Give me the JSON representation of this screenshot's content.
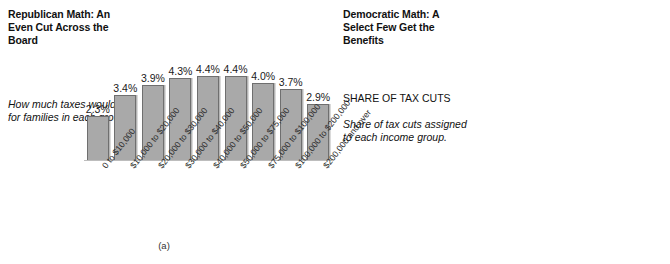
{
  "chart_data": [
    {
      "type": "bar",
      "panel": "a",
      "subfigure_label": "(a)",
      "title": "Republican Math: An Even Cut Across the Board",
      "caption": "How much taxes would fall for families in each group.",
      "legend_heading": "",
      "xlabel": "",
      "ylabel": "",
      "ylim": [
        0,
        30
      ],
      "grid": false,
      "legend": "none",
      "bar_color": "#a9a9a9",
      "bar_border_color": "#6f6f6f",
      "categories": [
        "0 to $10,000",
        "$10,000 to $20,000",
        "$20,000 to $30,000",
        "$30,000 to $40,000",
        "$40,000 to $50,000",
        "$50,000 to $75,000",
        "$75,000 to $100,000",
        "$100,000 to $200,000",
        "$200,000 and over"
      ],
      "values": [
        2.3,
        3.4,
        3.9,
        4.3,
        4.4,
        4.4,
        4.0,
        3.7,
        2.9
      ],
      "value_labels": [
        "2.3%",
        "3.4%",
        "3.9%",
        "4.3%",
        "4.4%",
        "4.4%",
        "4.0%",
        "3.7%",
        "2.9%"
      ]
    },
    {
      "type": "bar",
      "panel": "b",
      "subfigure_label": "(b)",
      "title": "Democratic Math: A Select Few Get the Benefits",
      "legend_heading": "SHARE OF TAX CUTS",
      "caption": "Share of tax cuts assigned to each income group.",
      "xlabel": "",
      "ylabel": "",
      "ylim": [
        0,
        30
      ],
      "grid": false,
      "legend": "none",
      "bar_color": "#a9a9a9",
      "bar_border_color": "#6f6f6f",
      "categories": [
        "0 to $10,000",
        "$10,000 to $20,000",
        "$20,000 to $30,000",
        "$30,000 to $50,000",
        "$50,000 to $75,000",
        "$75,000 to $100,000",
        "$100,000 to $200,000",
        "$200,000 and over"
      ],
      "values": [
        0.2,
        1.3,
        3.3,
        11.6,
        16.4,
        15.2,
        23.4,
        28.1
      ],
      "value_labels": [
        "0.2%",
        "1.3%",
        "3.3%",
        "11.6%",
        "16.4%",
        "15.2%",
        "23.4%",
        "28.1%"
      ]
    }
  ]
}
